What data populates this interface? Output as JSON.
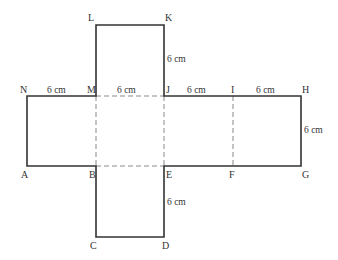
{
  "figure": {
    "type": "cube-net",
    "stroke_color": "#333333",
    "fold_color": "#888888",
    "vertices": {
      "L": "L",
      "K": "K",
      "N": "N",
      "M": "M",
      "J": "J",
      "I": "I",
      "H": "H",
      "A": "A",
      "B": "B",
      "E": "E",
      "F": "F",
      "G": "G",
      "C": "C",
      "D": "D"
    },
    "measurements": {
      "NM": "6 cm",
      "MJ": "6 cm",
      "JI": "6 cm",
      "IH": "6 cm",
      "KJ": "6 cm",
      "HG": "6 cm",
      "ED": "6 cm"
    }
  }
}
